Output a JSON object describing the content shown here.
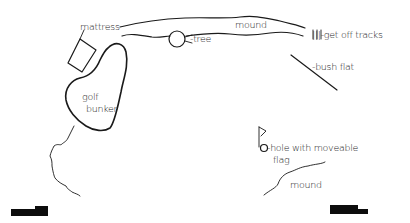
{
  "diagram": {
    "type": "hand-drawn site map",
    "labels": {
      "mattress": "mattress",
      "mound_top": "mound",
      "tree": "-tree",
      "get_off_tracks": "|||-get off tracks",
      "bush_flat": "-bush flat",
      "golf": "golf",
      "bunker": "bunker",
      "hole_line1": "-hole with moveable",
      "hole_line2": "flag",
      "mound_bottom": "mound"
    },
    "colors": {
      "ink": "#1a1a1a",
      "background": "#ffffff",
      "block": "#0d0d0d"
    }
  }
}
